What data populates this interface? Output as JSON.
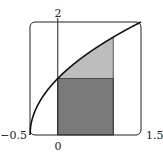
{
  "chart_data": {
    "type": "area",
    "title": "",
    "xlabel": "",
    "ylabel": "",
    "function": "y = sqrt(2x + 1)",
    "xlim": [
      -0.5,
      1.5
    ],
    "ylim": [
      0,
      2
    ],
    "grid": false,
    "legend": null,
    "tick_labels": {
      "x_left": "−0.5",
      "x_right": "1.5",
      "x_origin": "0",
      "y_top": "2"
    },
    "curve": {
      "x": [
        -0.5,
        -0.25,
        0,
        0.25,
        0.5,
        0.75,
        1.0,
        1.25,
        1.5
      ],
      "y": [
        0,
        0.707,
        1.0,
        1.225,
        1.414,
        1.581,
        1.732,
        1.871,
        2.0
      ]
    },
    "shaded_regions": [
      {
        "name": "rectangle",
        "x": [
          0,
          1
        ],
        "y": [
          0,
          1
        ],
        "color": "#7a7a7a"
      },
      {
        "name": "region-above-rectangle-below-curve",
        "x": [
          0,
          1
        ],
        "y_lower": 1,
        "y_upper": "sqrt(2x+1)",
        "color": "#bdbdbd"
      }
    ],
    "vertical_line_at": 0,
    "colors": {
      "curve": "#111111",
      "frame": "#222222",
      "dark_fill": "#7a7a7a",
      "light_fill": "#bdbdbd"
    }
  }
}
